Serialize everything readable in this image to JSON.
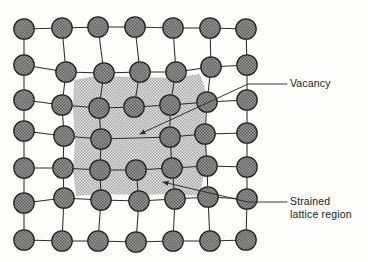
{
  "figure": {
    "background_color": "#fdfdfb",
    "atom_fill_color": "#8a8a8a",
    "atom_stroke_color": "#232323",
    "bond_color": "#2b2b2b",
    "shaded_region_color": "#b9b9b9",
    "atom_radius": 10.2
  },
  "labels": {
    "vacancy": {
      "text": "Vacancy",
      "x": 290,
      "y": 87
    },
    "strained_line1": {
      "text": "Strained",
      "x": 290,
      "y": 205
    },
    "strained_line2": {
      "text": "lattice region",
      "x": 290,
      "y": 218
    }
  },
  "chart_data": {
    "type": "diagram",
    "annotations": [
      "Vacancy",
      "Strained lattice region"
    ],
    "shaded_region_bounds": {
      "x_min": 73,
      "x_max": 206,
      "y_min": 76,
      "y_max": 196
    },
    "atoms": [
      {
        "id": "r0c0",
        "x": 24,
        "y": 29
      },
      {
        "id": "r0c1",
        "x": 62,
        "y": 28
      },
      {
        "id": "r0c2",
        "x": 98,
        "y": 27
      },
      {
        "id": "r0c3",
        "x": 135,
        "y": 27
      },
      {
        "id": "r0c4",
        "x": 173,
        "y": 28
      },
      {
        "id": "r0c5",
        "x": 210,
        "y": 28
      },
      {
        "id": "r0c6",
        "x": 246,
        "y": 29
      },
      {
        "id": "r1c0",
        "x": 24,
        "y": 65
      },
      {
        "id": "r1c1",
        "x": 66,
        "y": 72
      },
      {
        "id": "r1c2",
        "x": 104,
        "y": 73
      },
      {
        "id": "r1c3",
        "x": 140,
        "y": 72
      },
      {
        "id": "r1c4",
        "x": 176,
        "y": 72
      },
      {
        "id": "r1c5",
        "x": 211,
        "y": 67
      },
      {
        "id": "r1c6",
        "x": 247,
        "y": 65
      },
      {
        "id": "r2c0",
        "x": 24,
        "y": 100
      },
      {
        "id": "r2c1",
        "x": 62,
        "y": 105
      },
      {
        "id": "r2c2",
        "x": 99,
        "y": 108
      },
      {
        "id": "r2c3",
        "x": 134,
        "y": 107
      },
      {
        "id": "r2c4",
        "x": 170,
        "y": 105
      },
      {
        "id": "r2c5",
        "x": 207,
        "y": 102
      },
      {
        "id": "r2c6",
        "x": 247,
        "y": 100
      },
      {
        "id": "r3c0",
        "x": 24,
        "y": 131
      },
      {
        "id": "r3c1",
        "x": 64,
        "y": 136
      },
      {
        "id": "r3c2",
        "x": 101,
        "y": 139
      },
      {
        "id": "r3c3",
        "x": 170,
        "y": 137
      },
      {
        "id": "r3c4",
        "x": 205,
        "y": 134
      },
      {
        "id": "r3c5",
        "x": 247,
        "y": 133
      },
      {
        "id": "r4c0",
        "x": 24,
        "y": 168
      },
      {
        "id": "r4c1",
        "x": 63,
        "y": 168
      },
      {
        "id": "r4c2",
        "x": 100,
        "y": 170
      },
      {
        "id": "r4c3",
        "x": 136,
        "y": 170
      },
      {
        "id": "r4c4",
        "x": 172,
        "y": 168
      },
      {
        "id": "r4c5",
        "x": 207,
        "y": 166
      },
      {
        "id": "r4c6",
        "x": 247,
        "y": 167
      },
      {
        "id": "r5c0",
        "x": 24,
        "y": 203
      },
      {
        "id": "r5c1",
        "x": 64,
        "y": 198
      },
      {
        "id": "r5c2",
        "x": 101,
        "y": 200
      },
      {
        "id": "r5c3",
        "x": 139,
        "y": 201
      },
      {
        "id": "r5c4",
        "x": 175,
        "y": 199
      },
      {
        "id": "r5c5",
        "x": 208,
        "y": 197
      },
      {
        "id": "r5c6",
        "x": 247,
        "y": 199
      },
      {
        "id": "r6c0",
        "x": 24,
        "y": 240
      },
      {
        "id": "r6c1",
        "x": 62,
        "y": 241
      },
      {
        "id": "r6c2",
        "x": 98,
        "y": 241
      },
      {
        "id": "r6c3",
        "x": 136,
        "y": 242
      },
      {
        "id": "r6c4",
        "x": 173,
        "y": 241
      },
      {
        "id": "r6c5",
        "x": 210,
        "y": 241
      },
      {
        "id": "r6c6",
        "x": 246,
        "y": 240
      }
    ],
    "bonds": [
      [
        "r0c0",
        "r0c1"
      ],
      [
        "r0c1",
        "r0c2"
      ],
      [
        "r0c2",
        "r0c3"
      ],
      [
        "r0c3",
        "r0c4"
      ],
      [
        "r0c4",
        "r0c5"
      ],
      [
        "r0c5",
        "r0c6"
      ],
      [
        "r0c0",
        "r1c0"
      ],
      [
        "r0c1",
        "r1c1"
      ],
      [
        "r0c2",
        "r1c2"
      ],
      [
        "r0c3",
        "r1c3"
      ],
      [
        "r0c4",
        "r1c4"
      ],
      [
        "r0c5",
        "r1c5"
      ],
      [
        "r0c6",
        "r1c6"
      ],
      [
        "r1c0",
        "r1c1"
      ],
      [
        "r1c1",
        "r1c2"
      ],
      [
        "r1c2",
        "r1c3"
      ],
      [
        "r1c3",
        "r1c4"
      ],
      [
        "r1c4",
        "r1c5"
      ],
      [
        "r1c5",
        "r1c6"
      ],
      [
        "r1c0",
        "r2c0"
      ],
      [
        "r1c1",
        "r2c1"
      ],
      [
        "r1c2",
        "r2c2"
      ],
      [
        "r1c3",
        "r2c3"
      ],
      [
        "r1c4",
        "r2c4"
      ],
      [
        "r1c5",
        "r2c5"
      ],
      [
        "r1c6",
        "r2c6"
      ],
      [
        "r2c0",
        "r2c1"
      ],
      [
        "r2c1",
        "r2c2"
      ],
      [
        "r2c2",
        "r2c3"
      ],
      [
        "r2c3",
        "r2c4"
      ],
      [
        "r2c4",
        "r2c5"
      ],
      [
        "r2c5",
        "r2c6"
      ],
      [
        "r2c0",
        "r3c0"
      ],
      [
        "r2c1",
        "r3c1"
      ],
      [
        "r2c2",
        "r3c2"
      ],
      [
        "r2c4",
        "r3c3"
      ],
      [
        "r2c5",
        "r3c4"
      ],
      [
        "r2c6",
        "r3c5"
      ],
      [
        "r3c0",
        "r3c1"
      ],
      [
        "r3c1",
        "r3c2"
      ],
      [
        "r3c2",
        "r3c3"
      ],
      [
        "r3c3",
        "r3c4"
      ],
      [
        "r3c4",
        "r3c5"
      ],
      [
        "r3c0",
        "r4c0"
      ],
      [
        "r3c1",
        "r4c1"
      ],
      [
        "r3c2",
        "r4c2"
      ],
      [
        "r3c3",
        "r4c4"
      ],
      [
        "r3c4",
        "r4c5"
      ],
      [
        "r3c5",
        "r4c6"
      ],
      [
        "r4c0",
        "r4c1"
      ],
      [
        "r4c1",
        "r4c2"
      ],
      [
        "r4c2",
        "r4c3"
      ],
      [
        "r4c3",
        "r4c4"
      ],
      [
        "r4c4",
        "r4c5"
      ],
      [
        "r4c5",
        "r4c6"
      ],
      [
        "r4c0",
        "r5c0"
      ],
      [
        "r4c1",
        "r5c1"
      ],
      [
        "r4c2",
        "r5c2"
      ],
      [
        "r4c3",
        "r5c3"
      ],
      [
        "r4c4",
        "r5c4"
      ],
      [
        "r4c5",
        "r5c5"
      ],
      [
        "r4c6",
        "r5c6"
      ],
      [
        "r5c0",
        "r5c1"
      ],
      [
        "r5c1",
        "r5c2"
      ],
      [
        "r5c2",
        "r5c3"
      ],
      [
        "r5c3",
        "r5c4"
      ],
      [
        "r5c4",
        "r5c5"
      ],
      [
        "r5c5",
        "r5c6"
      ],
      [
        "r5c0",
        "r6c0"
      ],
      [
        "r5c1",
        "r6c1"
      ],
      [
        "r5c2",
        "r6c2"
      ],
      [
        "r5c3",
        "r6c3"
      ],
      [
        "r5c4",
        "r6c4"
      ],
      [
        "r5c5",
        "r6c5"
      ],
      [
        "r5c6",
        "r6c6"
      ],
      [
        "r6c0",
        "r6c1"
      ],
      [
        "r6c1",
        "r6c2"
      ],
      [
        "r6c2",
        "r6c3"
      ],
      [
        "r6c3",
        "r6c4"
      ],
      [
        "r6c4",
        "r6c5"
      ],
      [
        "r6c5",
        "r6c6"
      ]
    ],
    "leaders": [
      {
        "name": "vacancy-leader",
        "points": "287,84 248,84 140,134",
        "arrow_at": [
          140,
          134
        ]
      },
      {
        "name": "strained-leader",
        "points": "287,202 248,202 163,182",
        "arrow_at": [
          163,
          182
        ]
      }
    ]
  }
}
